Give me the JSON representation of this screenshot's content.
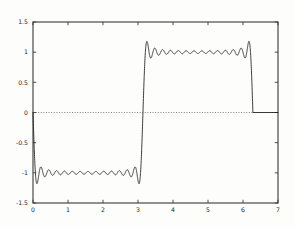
{
  "chart_data": {
    "type": "line",
    "title": "",
    "subtitle": "",
    "xlabel": "",
    "ylabel": "",
    "xlim": [
      0,
      7
    ],
    "ylim": [
      -1.5,
      1.5
    ],
    "xticks": [
      0,
      1,
      2,
      3,
      4,
      5,
      6,
      7
    ],
    "xticklabels": [
      "0",
      "1",
      "2",
      "3",
      "4",
      "5",
      "6",
      "7"
    ],
    "yticks": [
      -1.5,
      -1,
      -0.5,
      0,
      0.5,
      1,
      1.5
    ],
    "yticklabels": [
      "-1.5",
      "-1",
      "-0.5",
      "0",
      "0.5",
      "1",
      "1.5"
    ],
    "grid": false,
    "legend": null,
    "legend_position": "none",
    "annotations": [],
    "reference_lines": [
      {
        "name": "zero-line",
        "orientation": "horizontal",
        "value": 0,
        "style": "dotted",
        "x_start": 0,
        "x_end": 7
      }
    ],
    "series": [
      {
        "name": "fourier-partial-sum",
        "description": "Truncated Fourier sine series partial sum of a square wave",
        "style": "solid",
        "color": "#1c1c1c",
        "harmonics": 27,
        "harmonic_step": 2,
        "period": 6.283185307179586,
        "amplitude_coefficient": 1.2732395447351628,
        "domain_start": 0,
        "domain_end": 6.283185307179586,
        "target_square_wave": {
          "value_on_first_half": -1,
          "value_on_second_half": 1,
          "discontinuities": [
            0,
            3.141592653589793,
            6.283185307179586
          ]
        },
        "gibbs_overshoot_max": 1.1789797,
        "gibbs_undershoot_min": -1.1789797,
        "plateau_levels": [
          -1,
          1
        ],
        "tail_value_after_domain": 0
      }
    ]
  },
  "axes": {
    "frame": {
      "name": "plot-frame",
      "left_px": 33,
      "right_px": 278,
      "top_px": 22,
      "bottom_px": 203
    }
  }
}
